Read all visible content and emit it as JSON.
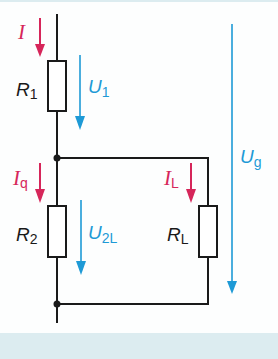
{
  "diagram": {
    "type": "voltage-divider-with-load",
    "colors": {
      "wire": "#1a1a1a",
      "current": "#d6265a",
      "voltage": "#1e9ad6",
      "background_band": "#dcecf0"
    },
    "resistors": [
      {
        "id": "R1",
        "symbol": "R",
        "subscript": "1"
      },
      {
        "id": "R2",
        "symbol": "R",
        "subscript": "2"
      },
      {
        "id": "RL",
        "symbol": "R",
        "subscript": "L"
      }
    ],
    "currents": [
      {
        "id": "I",
        "symbol": "I",
        "subscript": ""
      },
      {
        "id": "Iq",
        "symbol": "I",
        "subscript": "q"
      },
      {
        "id": "IL",
        "symbol": "I",
        "subscript": "L"
      }
    ],
    "voltages": [
      {
        "id": "U1",
        "symbol": "U",
        "subscript": "1"
      },
      {
        "id": "U2L",
        "symbol": "U",
        "subscript": "2L"
      },
      {
        "id": "Ug",
        "symbol": "U",
        "subscript": "g"
      }
    ]
  }
}
